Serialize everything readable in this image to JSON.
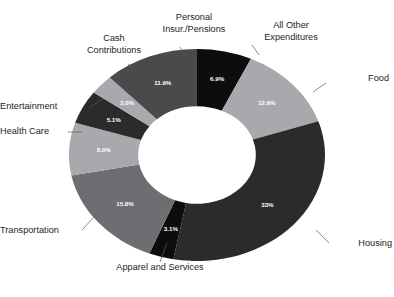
{
  "chart_data": {
    "type": "pie",
    "variant": "donut",
    "title": "",
    "subtitle": "",
    "xlabel": "",
    "ylabel": "",
    "legend_position": "none",
    "grid": false,
    "value_unit": "percent",
    "inner_radius_ratio": 0.46,
    "start_angle_deg": -90,
    "direction": "clockwise",
    "categories": [
      "All Other Expenditures",
      "Food",
      "Housing",
      "Apparel and Services",
      "Transportation",
      "Health Care",
      "Entertainment",
      "Cash Contributions",
      "Personal Insur./Pensions"
    ],
    "values": [
      6.9,
      12.9,
      33,
      3.1,
      15.8,
      8.0,
      5.1,
      3.0,
      11.9
    ],
    "value_labels": [
      "6.9%",
      "12.9%",
      "33%",
      "3.1%",
      "15.8%",
      "8.0%",
      "5.1%",
      "3.0%",
      "11.9%"
    ],
    "colors": [
      "#0d0d0d",
      "#a7a9ac",
      "#2b2b2b",
      "#0d0d0d",
      "#6d6e71",
      "#a7a9ac",
      "#2b2b2b",
      "#a7a9ac",
      "#4a4a4c"
    ],
    "label_text_color": "#ffffff",
    "background": "#ffffff",
    "leader_line_color": "#58595b"
  },
  "labels": {
    "all_other_expenditures": "All Other\nExpenditures",
    "food": "Food",
    "housing": "Housing",
    "apparel_and_services": "Apparel and Services",
    "transportation": "Transportation",
    "health_care": "Health Care",
    "entertainment": "Entertainment",
    "cash_contributions": "Cash\nContributions",
    "personal_insur_pensions": "Personal\nInsur./Pensions"
  }
}
